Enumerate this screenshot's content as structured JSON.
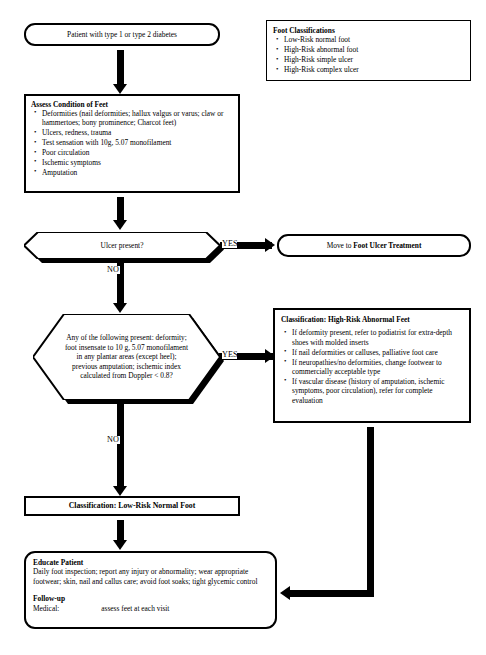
{
  "legend": {
    "heading": "Foot Classifications",
    "items": [
      "Low-Risk normal foot",
      "High-Risk abnormal foot",
      "High-Risk simple ulcer",
      "High-Risk complex ulcer"
    ]
  },
  "nodes": {
    "start": {
      "shape": "rounded-terminal",
      "text": "Patient with type 1 or type 2 diabetes"
    },
    "assess": {
      "shape": "process",
      "heading": "Assess Condition of Feet",
      "items": [
        "Deformities (nail deformities; hallux valgus or varus; claw or hammertoes; bony prominence; Charcot feet)",
        "Ulcers, redness, trauma",
        "Test sensation with 10g, 5.07 monofilament",
        "Poor circulation",
        "Ischemic symptoms",
        "Amputation"
      ]
    },
    "ulcer_decision": {
      "shape": "hexagon",
      "text": "Ulcer present?"
    },
    "ulcer_treatment": {
      "shape": "rounded-terminal",
      "text_prefix": "Move to ",
      "text_bold": "Foot Ulcer Treatment"
    },
    "risk_decision": {
      "shape": "hexagon",
      "text": "Any of the following present: deformity; foot insensate to 10 g, 5.07 monofilament in any plantar areas (except heel); previous amputation; ischemic index calculated from Doppler < 0.8?"
    },
    "high_risk": {
      "shape": "process",
      "heading": "Classification: High-Risk Abnormal Feet",
      "items": [
        "If deformity present, refer to podiatrist for extra-depth shoes with molded inserts",
        "If nail deformities or calluses, palliative foot care",
        "If neuropathies/no deformities, change footwear to commercially acceptable type",
        "If vascular disease (history of amputation, ischemic symptoms, poor circulation), refer for complete evaluation"
      ]
    },
    "low_risk": {
      "shape": "process",
      "heading": "Classification: Low-Risk Normal Foot"
    },
    "educate": {
      "shape": "rounded-process",
      "heading": "Educate Patient",
      "body": "Daily foot inspection; report any injury or abnormality; wear appropriate footwear; skin, nail and callus care; avoid foot soaks; tight glycemic control",
      "followup_heading": "Follow-up",
      "followup_label": "Medical:",
      "followup_value": "assess feet at each visit"
    }
  },
  "edges": {
    "ulcer_yes": "YES",
    "ulcer_no": "NO",
    "risk_yes": "YES",
    "risk_no": "NO"
  },
  "colors": {
    "stroke": "#000000",
    "fill": "#ffffff",
    "shadow": "#000000"
  }
}
